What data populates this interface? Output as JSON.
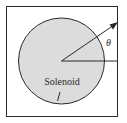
{
  "diagram": {
    "labels": {
      "solenoid": "Solenoid",
      "angle": "θ"
    },
    "colors": {
      "background": "#ffffff",
      "circle_fill": "#dcdcdc",
      "stroke": "#2a2a2a"
    },
    "elements": {
      "frame": "square boundary",
      "circle": "solenoid cross-section",
      "reference_line": "horizontal reference ray",
      "arrow": "rotating vector at angle theta"
    }
  }
}
